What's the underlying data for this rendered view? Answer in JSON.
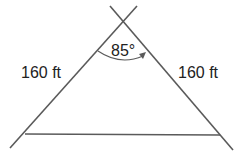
{
  "diagram": {
    "type": "isosceles-triangle",
    "left_side_label": "160 ft",
    "right_side_label": "160 ft",
    "apex_angle_label": "85°",
    "colors": {
      "line": "#5a5a5a",
      "text": "#222222",
      "background": "#ffffff"
    }
  }
}
